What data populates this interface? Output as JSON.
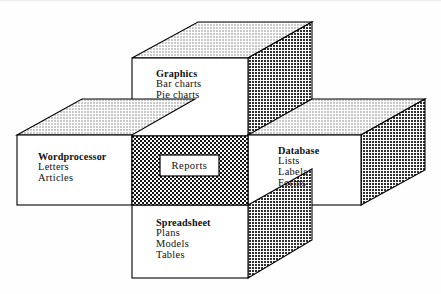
{
  "diagram": {
    "title_visible": false,
    "type": "integrated-software-suite-block-diagram",
    "center": {
      "label": "Reports",
      "name": "reports-core"
    },
    "modules": [
      {
        "id": "graphics",
        "position": "top",
        "heading": "Graphics",
        "items": [
          "Bar charts",
          "Pie charts"
        ]
      },
      {
        "id": "wordprocessor",
        "position": "left",
        "heading": "Wordprocessor",
        "items": [
          "Letters",
          "Articles"
        ]
      },
      {
        "id": "database",
        "position": "right",
        "heading": "Database",
        "items": [
          "Lists",
          "Labels",
          "Forms"
        ]
      },
      {
        "id": "spreadsheet",
        "position": "bottom",
        "heading": "Spreadsheet",
        "items": [
          "Plans",
          "Models",
          "Tables"
        ]
      }
    ],
    "colors": {
      "outline": "#000000",
      "face": "#ffffff",
      "top_fill": "#d7d7d7",
      "side_fill": "#bdbdbd",
      "center_hatch": "#2b2b2b",
      "background": "#fefefe"
    }
  }
}
